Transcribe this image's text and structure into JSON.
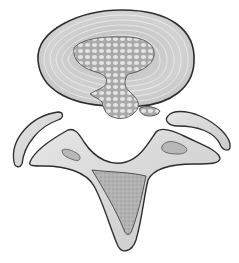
{
  "illustration": {
    "subject": "herniated intervertebral disc, axial view",
    "parts": [
      "annulus-fibrosus",
      "nucleus-pulposus",
      "herniation",
      "disc-fragment",
      "left-facet",
      "right-facet",
      "vertebral-arch",
      "spinous-process-core"
    ]
  },
  "colors": {
    "background": "#ffffff",
    "outline": "#333333",
    "annulus_fill": "#d4d4d4",
    "annulus_rings": "#f2f2f2",
    "nucleus_fill": "#bdbdbd",
    "nucleus_cells": "#e6e6e6",
    "bone_fill": "#dadada",
    "bone_core": "#a9a9a9"
  }
}
